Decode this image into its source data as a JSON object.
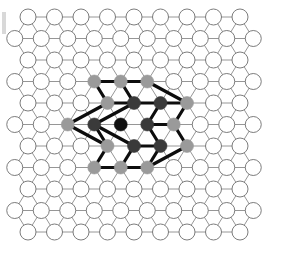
{
  "figure": {
    "type": "lattice-diagram",
    "background_color": "#ffffff"
  },
  "lattice": {
    "description": "Triangular (hexagonal close-packed) lattice of open circles",
    "rows": 11,
    "nodes_per_even_row": 9,
    "nodes_per_odd_row": 10,
    "x_spacing": 26.5,
    "y_spacing": 21.5,
    "origin_x": 28.0,
    "origin_y": 17.0,
    "odd_row_offset": -13.25,
    "node_radius": 8.0,
    "node_fill": "#ffffff",
    "node_stroke": "#6d6d6d",
    "node_stroke_width": 0.9,
    "bond_stroke": "#8a8a8a",
    "bond_stroke_width": 0.9
  },
  "cluster": {
    "description": "Central site plus two coordination shells highlighted with heavy black bonds",
    "center_row": 5,
    "center_col": 4,
    "shells": [
      {
        "name": "center-site",
        "count": 1,
        "color": "#111111",
        "radius": 6.5
      },
      {
        "name": "first-shell",
        "count": 6,
        "color": "#3a3a3a",
        "radius": 6.5
      },
      {
        "name": "second-shell",
        "count": 12,
        "color": "#9a9a9a",
        "radius": 6.5
      }
    ],
    "highlight_bond_color": "#0d0d0d",
    "highlight_bond_width": 3.2,
    "center": {
      "row": 5,
      "col": 4
    },
    "first_shell_cells": [
      {
        "row": 4,
        "col": 4
      },
      {
        "row": 4,
        "col": 5
      },
      {
        "row": 5,
        "col": 5
      },
      {
        "row": 6,
        "col": 5
      },
      {
        "row": 6,
        "col": 4
      },
      {
        "row": 5,
        "col": 3
      }
    ],
    "second_shell_cells": [
      {
        "row": 3,
        "col": 3
      },
      {
        "row": 3,
        "col": 4
      },
      {
        "row": 3,
        "col": 5
      },
      {
        "row": 4,
        "col": 6
      },
      {
        "row": 5,
        "col": 6
      },
      {
        "row": 6,
        "col": 6
      },
      {
        "row": 7,
        "col": 5
      },
      {
        "row": 7,
        "col": 4
      },
      {
        "row": 7,
        "col": 3
      },
      {
        "row": 6,
        "col": 3
      },
      {
        "row": 5,
        "col": 2
      },
      {
        "row": 4,
        "col": 3
      }
    ]
  },
  "artifact": {
    "name": "scan-edge-mark",
    "x": 2,
    "y": 12,
    "width": 4,
    "height": 22,
    "color": "#d8d8d8"
  }
}
